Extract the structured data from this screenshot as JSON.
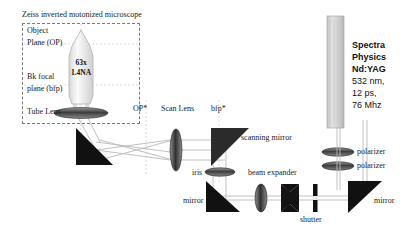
{
  "figure": {
    "title": "Zeiss inverted motonized microscope",
    "background_color": "#ffffff"
  },
  "microscope_box": {
    "label_object_plane_line1": "Object",
    "label_object_plane_line2": "Plane (OP)",
    "label_bfp_line1": "Bk focal",
    "label_bfp_line2": "plane (bfp)",
    "label_tube_lens": "Tube Lens",
    "objective_magnification": "63x",
    "objective_na": "1.4NA"
  },
  "beam_path_labels": {
    "op_conjugate": "OP*",
    "scan_lens": "Scan Lens",
    "bfp_conjugate": "bfp*",
    "scanning_mirror": "scanning mirror",
    "iris": "iris",
    "beam_expander": "beam expander",
    "mirror_left": "mirror",
    "shutter": "shutter",
    "mirror_right": "mirror",
    "polarizer_top": "polarizer",
    "polarizer_bottom": "polarizer"
  },
  "laser": {
    "brand_line1": "Spectra",
    "brand_line2": "Physics",
    "medium": "Nd:YAG",
    "wavelength": "532 nm,",
    "pulse_width": "12 ps,",
    "rep_rate": "76 Mhz"
  },
  "colors": {
    "beam": "#b9b9b9",
    "mirror_fill": "#111111",
    "lens_fill": "#555555",
    "laser_body": "#d2d2d2",
    "dashed_border": "#7a7a7a",
    "text": "#1a1a1a"
  }
}
